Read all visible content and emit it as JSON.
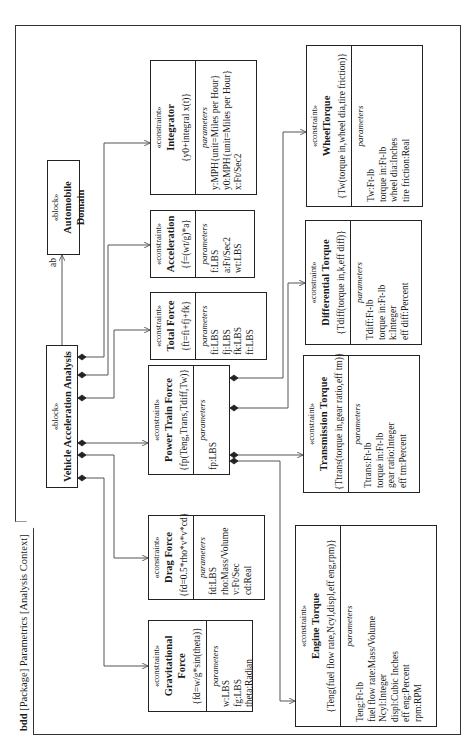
{
  "frame": {
    "kind": "bdd",
    "header": "[Package] Parametrics [Analysis Context]"
  },
  "blocks": {
    "vehicle": {
      "stereotype": "«block»",
      "name": "Vehicle Acceleration Analysis"
    },
    "domain": {
      "stereotype": "«block»",
      "name": "Automobile Domain"
    }
  },
  "association": {
    "role_label": "ab"
  },
  "constraints": {
    "integrator": {
      "stereotype": "«constraint»",
      "name": "Integrator",
      "expression": "{y0+integral x(t)}",
      "params_title": "parameters",
      "params": [
        "y:MPH{unit=Miles per Hour}",
        "y0:MPH{unit=Miles per Hour}",
        "x:Ft/Sec2"
      ]
    },
    "acceleration": {
      "stereotype": "«constraint»",
      "name": "Acceleration",
      "expression": "{f=(wt/g)*a}",
      "params_title": "parameters",
      "params": [
        "f:LBS",
        "a:Ft/Sec2",
        "wt:LBS"
      ]
    },
    "total_force": {
      "stereotype": "«constraint»",
      "name": "Total Force",
      "expression": "{ft=fi+fj+fk}",
      "params_title": "parameters",
      "params": [
        "fi:LBS",
        "fj:LBS",
        "fk:LBS",
        "ft:LBS"
      ]
    },
    "power_train": {
      "stereotype": "«constraint»",
      "name": "Power Train Force",
      "expression": "{fp(Teng,Trans,Tdiff,Tw)}",
      "params_title": "parameters",
      "params": [
        "fp:LBS"
      ]
    },
    "drag": {
      "stereotype": "«constraint»",
      "name": "Drag Force",
      "expression": "{fd=0.5*rho*v*v*cd}",
      "params_title": "parameters",
      "params": [
        "fd:LBS",
        "rho:Mass/Volume",
        "v:Ft/Sec",
        "cd:Real"
      ]
    },
    "gravitational": {
      "stereotype": "«constraint»",
      "name": "Gravitational Force",
      "expression": "{fd=w/g*sin(theta)}",
      "params_title": "parameters",
      "params": [
        "w:LBS",
        "fg:LBS",
        "theta:Radian"
      ]
    },
    "wheel_torque": {
      "stereotype": "«constraint»",
      "name": "WheelTorque",
      "expression": "{Tw(torque in,wheel dia,tire friction)}",
      "params_title": "parameters",
      "params": [
        "Tw:Ft-lb",
        "torque in:Ft-lb",
        "wheel dia:Inches",
        "tire friction:Real"
      ]
    },
    "differential": {
      "stereotype": "«constraint»",
      "name": "Differential Torque",
      "expression": "{Tdiff(torque in,k,eff diff)}",
      "params_title": "parameters",
      "params": [
        "Tdiff:Ft-lb",
        "torque in:Ft-lb",
        "k:Integer",
        "eff diff:Percent"
      ]
    },
    "transmission": {
      "stereotype": "«constraint»",
      "name": "Transmission Torque",
      "expression": "{Ttrans(torque in,gear ratio,eff tm)}",
      "params_title": "parameters",
      "params": [
        "Ttrans:Ft-lb",
        "torque in:Ft-lb",
        "gear ratio:Integer",
        "eff tm:Percent"
      ]
    },
    "engine": {
      "stereotype": "«constraint»",
      "name": "Engine Torque",
      "expression": "{Teng(fuel flow rate,Ncyl,displ,eff eng,rpm)}",
      "params_title": "parameters",
      "params": [
        "Teng:Ft-lb",
        "fuel flow rate:Mass/Volume",
        "Ncyl:Integer",
        "displ:Cubic Inches",
        "eff eng:Percent",
        "rpm:RPM"
      ]
    }
  },
  "colors": {
    "line": "#222222",
    "connector": "#555555",
    "background": "#ffffff"
  }
}
